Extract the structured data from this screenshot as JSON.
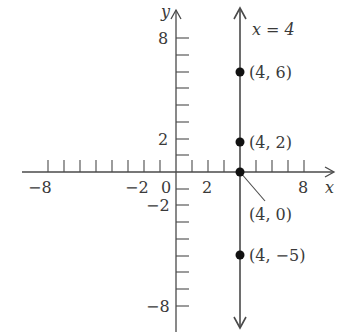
{
  "figure": {
    "line_label": "x = 4",
    "x_axis_label": "x",
    "y_axis_label": "y",
    "x_tick_labels": [
      {
        "value": -8,
        "text": "−8"
      },
      {
        "value": -2,
        "text": "−2"
      },
      {
        "value": 0,
        "text": "0"
      },
      {
        "value": 2,
        "text": "2"
      },
      {
        "value": 8,
        "text": "8"
      }
    ],
    "y_tick_labels": [
      {
        "value": 8,
        "text": "8"
      },
      {
        "value": 2,
        "text": "2"
      },
      {
        "value": -2,
        "text": "−2"
      },
      {
        "value": -8,
        "text": "−8"
      }
    ],
    "points": [
      {
        "x": 4,
        "y": 6,
        "label": "(4, 6)"
      },
      {
        "x": 4,
        "y": 2,
        "label": "(4, 2)"
      },
      {
        "x": 4,
        "y": 0,
        "label": "(4, 0)"
      },
      {
        "x": 4,
        "y": -5,
        "label": "(4, −5)"
      }
    ],
    "colors": {
      "axis": "#4a4a4a",
      "point": "#111111",
      "text": "#3a3a3a"
    }
  }
}
